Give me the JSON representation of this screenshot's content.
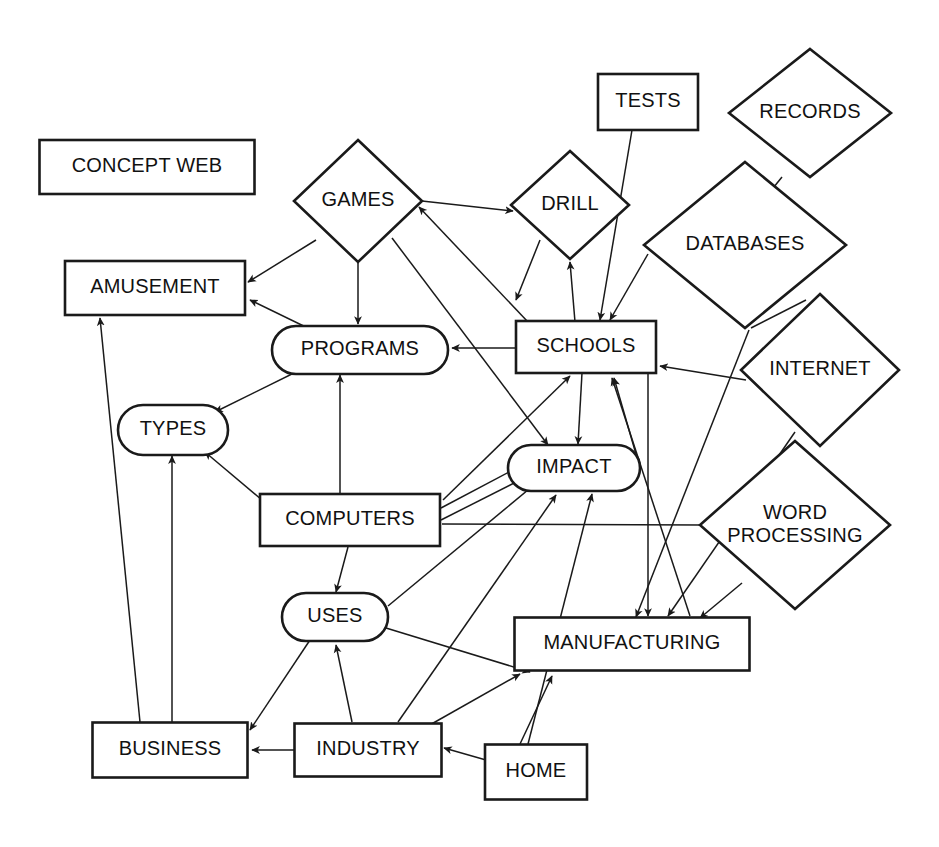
{
  "diagram": {
    "title": "CONCEPT WEB",
    "background_color": "#ffffff",
    "line_color": "#1a1a1a",
    "text_color": "#111111",
    "nodes": [
      {
        "id": "concept_web",
        "label": "CONCEPT WEB",
        "shape": "rect",
        "cx": 147,
        "cy": 167,
        "w": 215,
        "h": 54
      },
      {
        "id": "games",
        "label": "GAMES",
        "shape": "diamond",
        "cx": 358,
        "cy": 201,
        "w": 128,
        "h": 122
      },
      {
        "id": "tests",
        "label": "TESTS",
        "shape": "rect",
        "cx": 648,
        "cy": 102,
        "w": 100,
        "h": 56
      },
      {
        "id": "records",
        "label": "RECORDS",
        "shape": "diamond",
        "cx": 810,
        "cy": 113,
        "w": 162,
        "h": 128
      },
      {
        "id": "drill",
        "label": "DRILL",
        "shape": "diamond",
        "cx": 570,
        "cy": 205,
        "w": 118,
        "h": 108
      },
      {
        "id": "databases",
        "label": "DATABASES",
        "shape": "diamond",
        "cx": 745,
        "cy": 245,
        "w": 202,
        "h": 166
      },
      {
        "id": "amusement",
        "label": "AMUSEMENT",
        "shape": "rect",
        "cx": 155,
        "cy": 288,
        "w": 180,
        "h": 54
      },
      {
        "id": "schools",
        "label": "SCHOOLS",
        "shape": "rect",
        "cx": 586,
        "cy": 347,
        "w": 140,
        "h": 52
      },
      {
        "id": "programs",
        "label": "PROGRAMS",
        "shape": "rounded-rect",
        "cx": 360,
        "cy": 350,
        "w": 176,
        "h": 48
      },
      {
        "id": "internet",
        "label": "INTERNET",
        "shape": "diamond",
        "cx": 820,
        "cy": 370,
        "w": 158,
        "h": 152
      },
      {
        "id": "types",
        "label": "TYPES",
        "shape": "rounded-rect",
        "cx": 173,
        "cy": 430,
        "w": 110,
        "h": 50
      },
      {
        "id": "impact",
        "label": "IMPACT",
        "shape": "rounded-rect",
        "cx": 574,
        "cy": 468,
        "w": 132,
        "h": 46
      },
      {
        "id": "word_processing",
        "label": "WORD\nPROCESSING",
        "shape": "diamond",
        "cx": 795,
        "cy": 525,
        "w": 190,
        "h": 168
      },
      {
        "id": "computers",
        "label": "COMPUTERS",
        "shape": "rect",
        "cx": 350,
        "cy": 520,
        "w": 180,
        "h": 52
      },
      {
        "id": "uses",
        "label": "USES",
        "shape": "rounded-rect",
        "cx": 335,
        "cy": 617,
        "w": 106,
        "h": 48
      },
      {
        "id": "manufacturing",
        "label": "MANUFACTURING",
        "shape": "rect",
        "cx": 632,
        "cy": 644,
        "w": 235,
        "h": 53
      },
      {
        "id": "business",
        "label": "BUSINESS",
        "shape": "rect",
        "cx": 170,
        "cy": 750,
        "w": 155,
        "h": 55
      },
      {
        "id": "industry",
        "label": "INDUSTRY",
        "shape": "rect",
        "cx": 368,
        "cy": 750,
        "w": 147,
        "h": 53
      },
      {
        "id": "home",
        "label": "HOME",
        "shape": "rect",
        "cx": 536,
        "cy": 772,
        "w": 102,
        "h": 55
      }
    ],
    "edges": [
      {
        "from": "games",
        "to": "amusement",
        "arrow": "end",
        "x1": 316,
        "y1": 240,
        "x2": 248,
        "y2": 282
      },
      {
        "from": "games",
        "to": "programs",
        "arrow": "end",
        "x1": 358,
        "y1": 262,
        "x2": 358,
        "y2": 324
      },
      {
        "from": "games",
        "to": "drill",
        "arrow": "end",
        "x1": 422,
        "y1": 201,
        "x2": 513,
        "y2": 211
      },
      {
        "from": "games",
        "to": "impact",
        "arrow": "end",
        "x1": 392,
        "y1": 238,
        "x2": 548,
        "y2": 445
      },
      {
        "from": "schools",
        "to": "games",
        "arrow": "end",
        "x1": 528,
        "y1": 322,
        "x2": 419,
        "y2": 207
      },
      {
        "from": "schools",
        "to": "programs",
        "arrow": "end",
        "x1": 516,
        "y1": 348,
        "x2": 452,
        "y2": 348
      },
      {
        "from": "schools",
        "to": "drill",
        "arrow": "end",
        "x1": 575,
        "y1": 322,
        "x2": 570,
        "y2": 262
      },
      {
        "from": "schools",
        "to": "impact",
        "arrow": "end",
        "x1": 582,
        "y1": 373,
        "x2": 578,
        "y2": 444
      },
      {
        "from": "tests",
        "to": "schools",
        "arrow": "end",
        "x1": 632,
        "y1": 130,
        "x2": 600,
        "y2": 320
      },
      {
        "from": "records",
        "to": "databases",
        "arrow": "none",
        "x1": 782,
        "y1": 177,
        "x2": 757,
        "y2": 208
      },
      {
        "from": "databases",
        "to": "schools",
        "arrow": "end",
        "x1": 648,
        "y1": 254,
        "x2": 610,
        "y2": 320
      },
      {
        "from": "databases",
        "to": "internet",
        "arrow": "none",
        "x1": 751,
        "y1": 328,
        "x2": 806,
        "y2": 300
      },
      {
        "from": "databases",
        "to": "manufacturing",
        "arrow": "end",
        "x1": 749,
        "y1": 330,
        "x2": 636,
        "y2": 617
      },
      {
        "from": "internet",
        "to": "schools",
        "arrow": "end",
        "x1": 746,
        "y1": 380,
        "x2": 660,
        "y2": 366
      },
      {
        "from": "internet",
        "to": "manufacturing",
        "arrow": "end",
        "x1": 795,
        "y1": 432,
        "x2": 668,
        "y2": 616
      },
      {
        "from": "word_processing",
        "to": "manufacturing",
        "arrow": "end",
        "x1": 742,
        "y1": 583,
        "x2": 700,
        "y2": 618
      },
      {
        "from": "programs",
        "to": "amusement",
        "arrow": "end",
        "x1": 316,
        "y1": 332,
        "x2": 250,
        "y2": 300
      },
      {
        "from": "programs",
        "to": "types",
        "arrow": "end",
        "x1": 300,
        "y1": 370,
        "x2": 215,
        "y2": 412
      },
      {
        "from": "computers",
        "to": "programs",
        "arrow": "end",
        "x1": 340,
        "y1": 493,
        "x2": 340,
        "y2": 375
      },
      {
        "from": "computers",
        "to": "types",
        "arrow": "end",
        "x1": 262,
        "y1": 500,
        "x2": 205,
        "y2": 452
      },
      {
        "from": "computers",
        "to": "uses",
        "arrow": "end",
        "x1": 348,
        "y1": 547,
        "x2": 336,
        "y2": 592
      },
      {
        "from": "computers",
        "to": "impact",
        "arrow": "end",
        "x1": 441,
        "y1": 508,
        "x2": 528,
        "y2": 462
      },
      {
        "from": "computers",
        "to": "impact",
        "arrow": "end",
        "x1": 441,
        "y1": 520,
        "x2": 524,
        "y2": 478
      },
      {
        "from": "computers",
        "to": "schools",
        "arrow": "end",
        "x1": 443,
        "y1": 500,
        "x2": 570,
        "y2": 376
      },
      {
        "from": "computers",
        "to": "word_processing",
        "arrow": "none",
        "x1": 442,
        "y1": 524,
        "x2": 702,
        "y2": 525
      },
      {
        "from": "uses",
        "to": "business",
        "arrow": "end",
        "x1": 310,
        "y1": 640,
        "x2": 250,
        "y2": 730
      },
      {
        "from": "uses",
        "to": "impact",
        "arrow": "end",
        "x1": 388,
        "y1": 606,
        "x2": 540,
        "y2": 480
      },
      {
        "from": "uses",
        "to": "manufacturing",
        "arrow": "end",
        "x1": 386,
        "y1": 628,
        "x2": 530,
        "y2": 672
      },
      {
        "from": "industry",
        "to": "uses",
        "arrow": "end",
        "x1": 352,
        "y1": 722,
        "x2": 336,
        "y2": 645
      },
      {
        "from": "industry",
        "to": "business",
        "arrow": "end",
        "x1": 295,
        "y1": 750,
        "x2": 252,
        "y2": 750
      },
      {
        "from": "industry",
        "to": "impact",
        "arrow": "end",
        "x1": 398,
        "y1": 722,
        "x2": 556,
        "y2": 495
      },
      {
        "from": "industry",
        "to": "manufacturing",
        "arrow": "end",
        "x1": 428,
        "y1": 726,
        "x2": 520,
        "y2": 674
      },
      {
        "from": "home",
        "to": "industry",
        "arrow": "end",
        "x1": 486,
        "y1": 760,
        "x2": 444,
        "y2": 748
      },
      {
        "from": "home",
        "to": "manufacturing",
        "arrow": "end",
        "x1": 520,
        "y1": 744,
        "x2": 552,
        "y2": 676
      },
      {
        "from": "home",
        "to": "impact",
        "arrow": "end",
        "x1": 528,
        "y1": 744,
        "x2": 592,
        "y2": 494
      },
      {
        "from": "business",
        "to": "amusement",
        "arrow": "end",
        "x1": 140,
        "y1": 722,
        "x2": 100,
        "y2": 318
      },
      {
        "from": "business",
        "to": "types",
        "arrow": "end",
        "x1": 172,
        "y1": 722,
        "x2": 172,
        "y2": 456
      },
      {
        "from": "schools",
        "to": "manufacturing",
        "arrow": "end",
        "x1": 648,
        "y1": 374,
        "x2": 648,
        "y2": 616
      },
      {
        "from": "impact",
        "to": "schools",
        "arrow": "end",
        "x1": 640,
        "y1": 468,
        "x2": 614,
        "y2": 378
      },
      {
        "from": "manufacturing",
        "to": "schools",
        "arrow": "end",
        "x1": 690,
        "y1": 616,
        "x2": 612,
        "y2": 378
      },
      {
        "from": "drill",
        "to": "impact",
        "arrow": "end",
        "x1": 540,
        "y1": 240,
        "x2": 516,
        "y2": 300
      }
    ],
    "bottom_fragment_text": "WEB"
  }
}
